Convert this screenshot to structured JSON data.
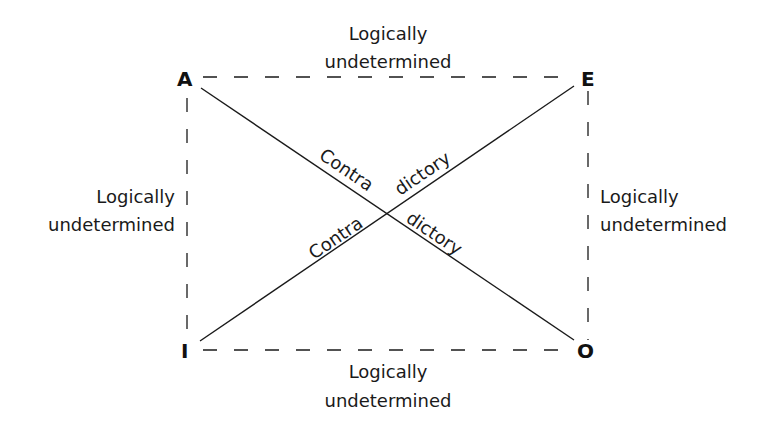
{
  "diagram": {
    "type": "square-of-opposition",
    "vertices": {
      "top_left": "A",
      "top_right": "E",
      "bottom_left": "I",
      "bottom_right": "O"
    },
    "edges": {
      "top": {
        "line1": "Logically",
        "line2": "undetermined"
      },
      "left": {
        "line1": "Logically",
        "line2": "undetermined"
      },
      "right": {
        "line1": "Logically",
        "line2": "undetermined"
      },
      "bottom": {
        "line1": "Logically",
        "line2": "undetermined"
      }
    },
    "diagonals": {
      "a_to_o": {
        "part1": "Contra",
        "part2": "dictory"
      },
      "i_to_e": {
        "part1": "Contra",
        "part2": "dictory"
      }
    },
    "colors": {
      "line": "#1a1a1a",
      "background": "#ffffff"
    }
  }
}
